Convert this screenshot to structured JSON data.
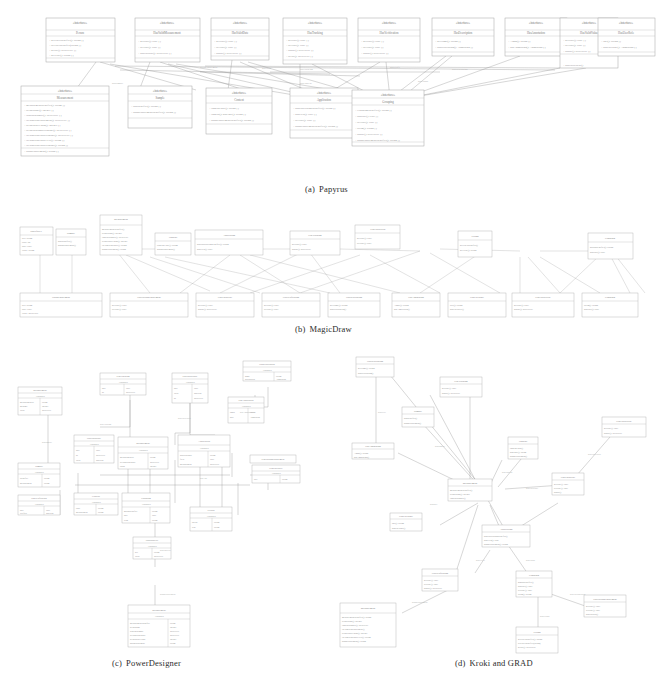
{
  "figure": {
    "kind": "four-panel comparison figure",
    "background": "#ffffff",
    "ink": "#8c8c8c",
    "panels": [
      {
        "id": "a",
        "label": "(a)",
        "name": "Papyrus",
        "caption": "Papyrus",
        "layout": "two-row orthogonal grid, nine interface boxes on top row, six class boxes on bottom row",
        "caption_x": 305,
        "caption_y": 190
      },
      {
        "id": "b",
        "label": "(b)",
        "name": "MagicDraw",
        "caption": "MagicDraw",
        "layout": "wide flat two-band layout with long diagonal connectors",
        "caption_x": 295,
        "caption_y": 330
      },
      {
        "id": "c",
        "label": "(c)",
        "name": "PowerDesigner",
        "caption": "PowerDesigner",
        "layout": "dense clustered orthogonal routing with a vertical chain descending at the bottom",
        "caption_x": 112,
        "caption_y": 664
      },
      {
        "id": "d",
        "label": "(d)",
        "name": "Kroki and GRAD",
        "caption": "Kroki and GRAD",
        "layout": "radial force-directed spread with straight diagonal edges around two central hubs",
        "caption_x": 455,
        "caption_y": 664
      }
    ],
    "papyrus": {
      "top_row_boxes": [
        {
          "x": 46,
          "y": 18,
          "w": 69,
          "h": 44,
          "title": "«interface»",
          "rows": 4
        },
        {
          "x": 135,
          "y": 18,
          "w": 65,
          "h": 44,
          "title": "«interface»",
          "rows": 3
        },
        {
          "x": 211,
          "y": 18,
          "w": 58,
          "h": 42,
          "title": "«interface»",
          "rows": 3
        },
        {
          "x": 283,
          "y": 18,
          "w": 64,
          "h": 46,
          "title": "«interface»",
          "rows": 4
        },
        {
          "x": 358,
          "y": 18,
          "w": 62,
          "h": 44,
          "title": "«interface»",
          "rows": 3
        },
        {
          "x": 432,
          "y": 18,
          "w": 62,
          "h": 38,
          "title": "«interface»",
          "rows": 2
        },
        {
          "x": 505,
          "y": 18,
          "w": 62,
          "h": 38,
          "title": "«interface»",
          "rows": 2
        },
        {
          "x": 560,
          "y": 18,
          "w": 58,
          "h": 50,
          "title": "«interface»",
          "rows": 3
        },
        {
          "x": 598,
          "y": 18,
          "w": 57,
          "h": 38,
          "title": "«interface»",
          "rows": 2
        }
      ],
      "bottom_row_boxes": [
        {
          "x": 21,
          "y": 86,
          "w": 88,
          "h": 70,
          "title": "«interface»",
          "rows": 10
        },
        {
          "x": 128,
          "y": 86,
          "w": 64,
          "h": 42,
          "title": "«interface»",
          "rows": 2
        },
        {
          "x": 206,
          "y": 88,
          "w": 66,
          "h": 46,
          "title": "«interface»",
          "rows": 3
        },
        {
          "x": 290,
          "y": 88,
          "w": 68,
          "h": 50,
          "title": "«interface»",
          "rows": 4
        },
        {
          "x": 352,
          "y": 90,
          "w": 72,
          "h": 56,
          "title": "«interface»",
          "rows": 6
        }
      ]
    }
  }
}
